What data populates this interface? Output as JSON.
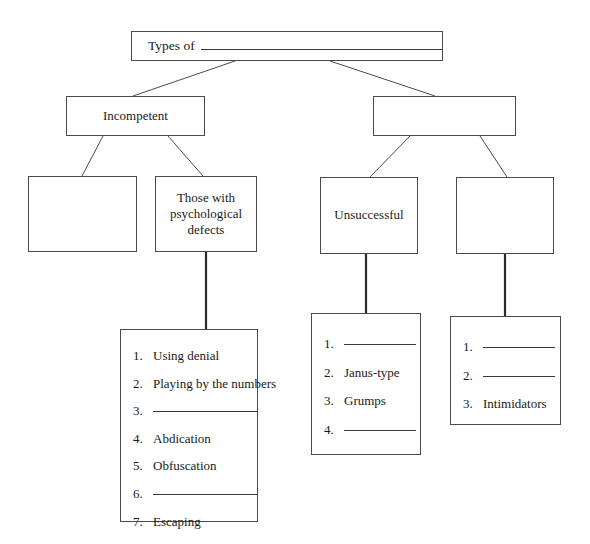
{
  "diagram": {
    "type": "hierarchy-tree-worksheet",
    "root": {
      "prefix_text": "Types of",
      "blank": true
    },
    "level2": [
      {
        "label": "Incompetent"
      },
      {
        "label": ""
      }
    ],
    "level3": [
      {
        "label": ""
      },
      {
        "label": "Those with psychological defects"
      },
      {
        "label": "Unsuccessful"
      },
      {
        "label": ""
      }
    ],
    "lists": [
      {
        "id": "list-psychological-defects",
        "items": [
          {
            "number": "1.",
            "text": "Using denial",
            "blank": false
          },
          {
            "number": "2.",
            "text": "Playing by the numbers",
            "blank": false
          },
          {
            "number": "3.",
            "text": "",
            "blank": true
          },
          {
            "number": "4.",
            "text": "Abdication",
            "blank": false
          },
          {
            "number": "5.",
            "text": "Obfuscation",
            "blank": false
          },
          {
            "number": "6.",
            "text": "",
            "blank": true
          },
          {
            "number": "7.",
            "text": "Escaping",
            "blank": false
          }
        ]
      },
      {
        "id": "list-unsuccessful",
        "items": [
          {
            "number": "1.",
            "text": "",
            "blank": true
          },
          {
            "number": "2.",
            "text": "Janus-type",
            "blank": false
          },
          {
            "number": "3.",
            "text": "Grumps",
            "blank": false
          },
          {
            "number": "4.",
            "text": "",
            "blank": true
          }
        ]
      },
      {
        "id": "list-right",
        "items": [
          {
            "number": "1.",
            "text": "",
            "blank": true
          },
          {
            "number": "2.",
            "text": "",
            "blank": true
          },
          {
            "number": "3.",
            "text": "Intimidators",
            "blank": false
          }
        ]
      }
    ],
    "colors": {
      "background": "#ffffff",
      "line": "#4a4a4a",
      "text": "#1a1a1a"
    }
  }
}
